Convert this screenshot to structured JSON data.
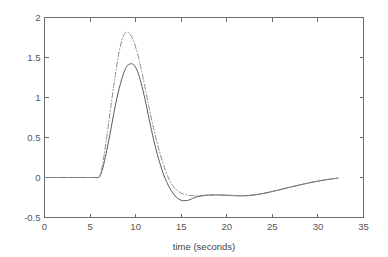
{
  "chart_data": {
    "type": "line",
    "title": "",
    "subtitle": "",
    "xlabel": "time (seconds)",
    "ylabel": "",
    "xlim": [
      0,
      35
    ],
    "ylim": [
      -0.5,
      2
    ],
    "xticks": [
      0,
      5,
      10,
      15,
      20,
      25,
      30,
      35
    ],
    "xtick_labels": [
      "0",
      "5",
      "10",
      "15",
      "20",
      "25",
      "30",
      "35"
    ],
    "yticks": [
      -0.5,
      0,
      0.5,
      1,
      1.5,
      2
    ],
    "ytick_labels": [
      "-0.5",
      "0",
      "0.5",
      "1",
      "1.5",
      "2"
    ],
    "grid": false,
    "legend": null,
    "legend_position": "none",
    "box": true,
    "tick_direction": "in",
    "colors": {
      "solid": "#5a5a5a",
      "dashdot": "#8a8a8a",
      "axis": "#6b6b6b",
      "text": "#555555",
      "background": "#ffffff"
    },
    "series": [
      {
        "name": "solid-response",
        "style": "solid",
        "color": "#5a5a5a",
        "x": [
          0,
          1,
          2,
          3,
          4,
          5,
          5.5,
          5.9,
          6.1,
          6.4,
          6.8,
          7.2,
          7.6,
          8.0,
          8.4,
          8.8,
          9.2,
          9.6,
          9.8,
          10.2,
          10.6,
          11.0,
          11.5,
          12.0,
          12.5,
          13.0,
          13.5,
          14.0,
          14.5,
          15.0,
          15.5,
          16.0,
          16.5,
          17.0,
          17.5,
          18.0,
          18.5,
          19.0,
          20.0,
          21.0,
          22.0,
          23.0,
          24.0,
          25.0,
          26.0,
          27.0,
          28.0,
          29.0,
          30.0,
          31.0,
          32.2
        ],
        "y": [
          0,
          0,
          0,
          0,
          0,
          0,
          0,
          0,
          0.02,
          0.12,
          0.32,
          0.55,
          0.8,
          1.02,
          1.2,
          1.34,
          1.41,
          1.42,
          1.41,
          1.33,
          1.18,
          0.99,
          0.72,
          0.46,
          0.24,
          0.06,
          -0.08,
          -0.18,
          -0.25,
          -0.285,
          -0.29,
          -0.275,
          -0.25,
          -0.235,
          -0.225,
          -0.22,
          -0.218,
          -0.218,
          -0.222,
          -0.228,
          -0.228,
          -0.218,
          -0.2,
          -0.175,
          -0.148,
          -0.12,
          -0.093,
          -0.068,
          -0.046,
          -0.026,
          -0.008
        ]
      },
      {
        "name": "dashdot-response",
        "style": "dash-dot",
        "color": "#8a8a8a",
        "x": [
          0,
          1,
          2,
          3,
          4,
          5,
          5.5,
          5.9,
          6.1,
          6.4,
          6.8,
          7.2,
          7.6,
          8.0,
          8.2,
          8.5,
          8.8,
          9.1,
          9.4,
          9.8,
          10.2,
          10.6,
          11.0,
          11.5,
          12.0,
          12.5,
          13.0,
          13.5,
          14.0,
          14.5,
          15.0,
          15.5,
          16.0,
          16.5,
          17.0,
          17.5,
          18.0,
          19.0,
          20.0,
          21.0,
          22.0,
          23.0,
          24.0,
          25.0,
          26.0,
          27.0,
          28.0,
          29.0,
          30.0,
          31.0,
          32.2
        ],
        "y": [
          0,
          0,
          0,
          0,
          0,
          0,
          0,
          0,
          0.03,
          0.18,
          0.48,
          0.82,
          1.15,
          1.45,
          1.58,
          1.72,
          1.8,
          1.815,
          1.79,
          1.7,
          1.55,
          1.36,
          1.14,
          0.86,
          0.6,
          0.37,
          0.18,
          0.02,
          -0.09,
          -0.155,
          -0.195,
          -0.215,
          -0.225,
          -0.228,
          -0.226,
          -0.222,
          -0.219,
          -0.218,
          -0.221,
          -0.226,
          -0.227,
          -0.217,
          -0.199,
          -0.174,
          -0.147,
          -0.119,
          -0.092,
          -0.067,
          -0.045,
          -0.025,
          -0.008
        ]
      }
    ]
  },
  "figure": {
    "xlabel": "time (seconds)"
  }
}
